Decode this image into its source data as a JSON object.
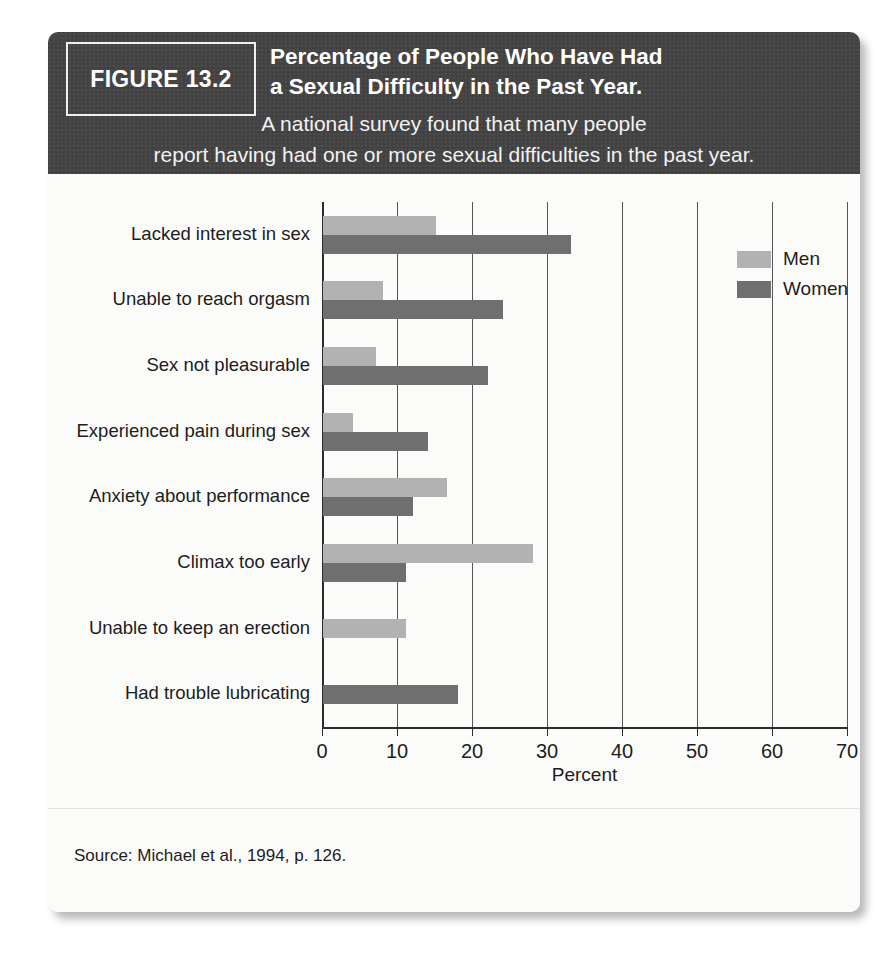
{
  "figure": {
    "badge_label": "FIGURE 13.2",
    "title_line1": "Percentage of People Who Have Had",
    "title_line2": "a Sexual Difficulty in the Past Year.",
    "subtitle_line1": "A national survey found that many people",
    "subtitle_line2": "report having had one or more sexual difficulties in the past year.",
    "source": "Source: Michael et al., 1994, p. 126."
  },
  "colors": {
    "header_background": "#434343",
    "card_background": "#fbfbf9",
    "men_bar": "#b2b2b2",
    "women_bar": "#6f6f6f",
    "axis": "#2b2b2b",
    "gridline": "#555555",
    "text": "#1d1d1d"
  },
  "legend": {
    "position": "top-right",
    "items": [
      {
        "label": "Men",
        "color": "#b2b2b2"
      },
      {
        "label": "Women",
        "color": "#6f6f6f"
      }
    ]
  },
  "chart_data": {
    "type": "bar",
    "orientation": "horizontal",
    "title": "Percentage of People Who Have Had a Sexual Difficulty in the Past Year.",
    "subtitle": "A national survey found that many people report having had one or more sexual difficulties in the past year.",
    "xlabel": "Percent",
    "ylabel": "",
    "xlim": [
      0,
      70
    ],
    "xticks": [
      0,
      10,
      20,
      30,
      40,
      50,
      60,
      70
    ],
    "xtick_labels": [
      "0",
      "10",
      "20",
      "30",
      "40",
      "50",
      "60",
      "70"
    ],
    "grid": "vertical",
    "legend_position": "top-right",
    "categories": [
      "Lacked interest in sex",
      "Unable to reach orgasm",
      "Sex not pleasurable",
      "Experienced pain during sex",
      "Anxiety about performance",
      "Climax too early",
      "Unable to keep an erection",
      "Had trouble lubricating"
    ],
    "series": [
      {
        "name": "Men",
        "color": "#b2b2b2",
        "values": [
          15,
          8,
          7,
          4,
          16.5,
          28,
          11,
          null
        ]
      },
      {
        "name": "Women",
        "color": "#6f6f6f",
        "values": [
          33,
          24,
          22,
          14,
          12,
          11,
          null,
          18
        ]
      }
    ],
    "source": "Source: Michael et al., 1994, p. 126."
  }
}
